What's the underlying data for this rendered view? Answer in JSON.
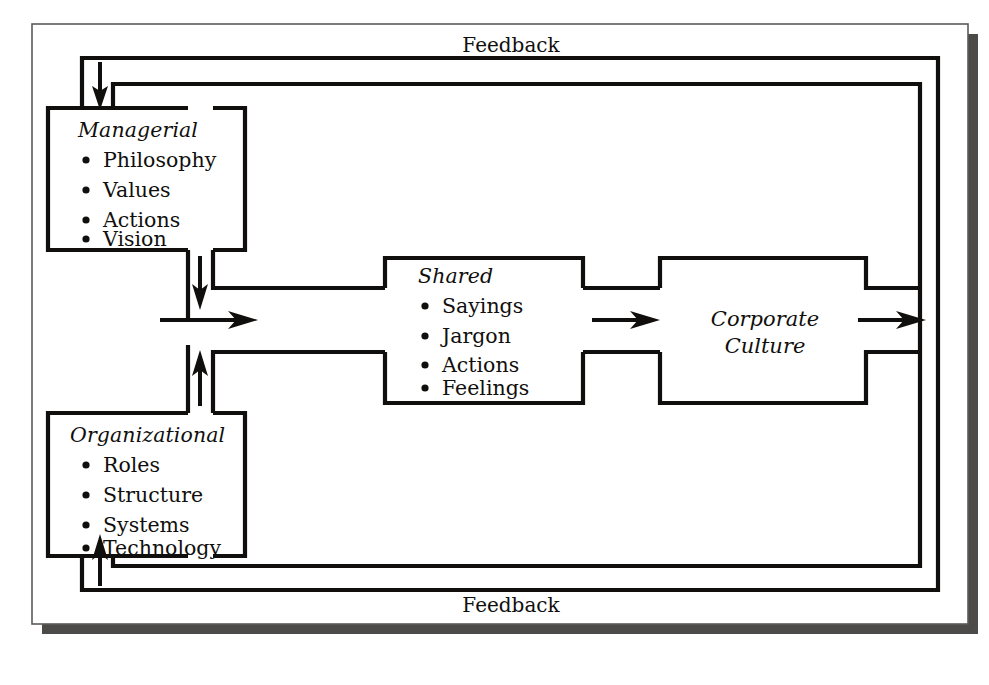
{
  "diagram": {
    "type": "flow-diagram",
    "title_visible": false,
    "boxes": [
      {
        "id": "managerial",
        "title": "Managerial",
        "items": [
          "Philosophy",
          "Values",
          "Actions",
          "Vision"
        ]
      },
      {
        "id": "organizational",
        "title": "Organizational",
        "items": [
          "Roles",
          "Structure",
          "Systems",
          "Technology"
        ]
      },
      {
        "id": "shared",
        "title": "Shared",
        "items": [
          "Sayings",
          "Jargon",
          "Actions",
          "Feelings"
        ]
      }
    ],
    "outcome": {
      "id": "corporate-culture",
      "line1": "Corporate",
      "line2": "Culture"
    },
    "feedback": {
      "top_label": "Feedback",
      "bottom_label": "Feedback"
    },
    "colors": {
      "line": "#100f0d",
      "frame": "#5b5a58",
      "shadow": "#4c4b49",
      "background": "#ffffff"
    }
  }
}
